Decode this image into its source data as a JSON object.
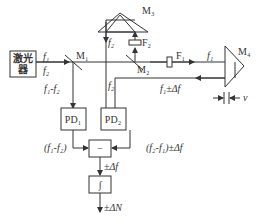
{
  "diagram": {
    "components": {
      "laser": {
        "label_line1": "激光",
        "label_line2": "器"
      },
      "m1": {
        "label": "M₁"
      },
      "m2": {
        "label": "M₂"
      },
      "m3": {
        "label": "M₃"
      },
      "m4": {
        "label": "M₄"
      },
      "f1_filter": {
        "label": "F₁"
      },
      "f2_filter": {
        "label": "F₂"
      },
      "pd1": {
        "label": "PD₁"
      },
      "pd2": {
        "label": "PD₂"
      },
      "subtractor": {
        "label": "−"
      },
      "integrator": {
        "label": "∫"
      }
    },
    "signals": {
      "laser_f1": "f₁",
      "laser_f2": "f₂",
      "m1_down": "f₁-f₂",
      "m3_f2": "f₂",
      "m2_f2": "f₂",
      "beam_f1": "f₁",
      "return_beam": "f₁±Δf",
      "velocity": "v",
      "pd1_out": "(f₁-f₂)",
      "pd2_out": "(f₂-f₁)±Δf",
      "sub_out": "±Δf",
      "int_out": "±ΔN"
    }
  }
}
